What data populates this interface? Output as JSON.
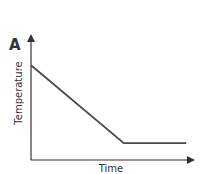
{
  "chart_data": {
    "type": "line",
    "panel_label": "A",
    "title": "",
    "xlabel": "Time",
    "ylabel": "Temperature",
    "xlim": [
      0,
      10
    ],
    "ylim": [
      0,
      10
    ],
    "grid": false,
    "legend": null,
    "series": [
      {
        "name": "temperature",
        "x": [
          0,
          5.8,
          9.7
        ],
        "y": [
          7.9,
          1.4,
          1.4
        ]
      }
    ],
    "line_color": "#4a4a4a",
    "axis_color": "#333333"
  }
}
